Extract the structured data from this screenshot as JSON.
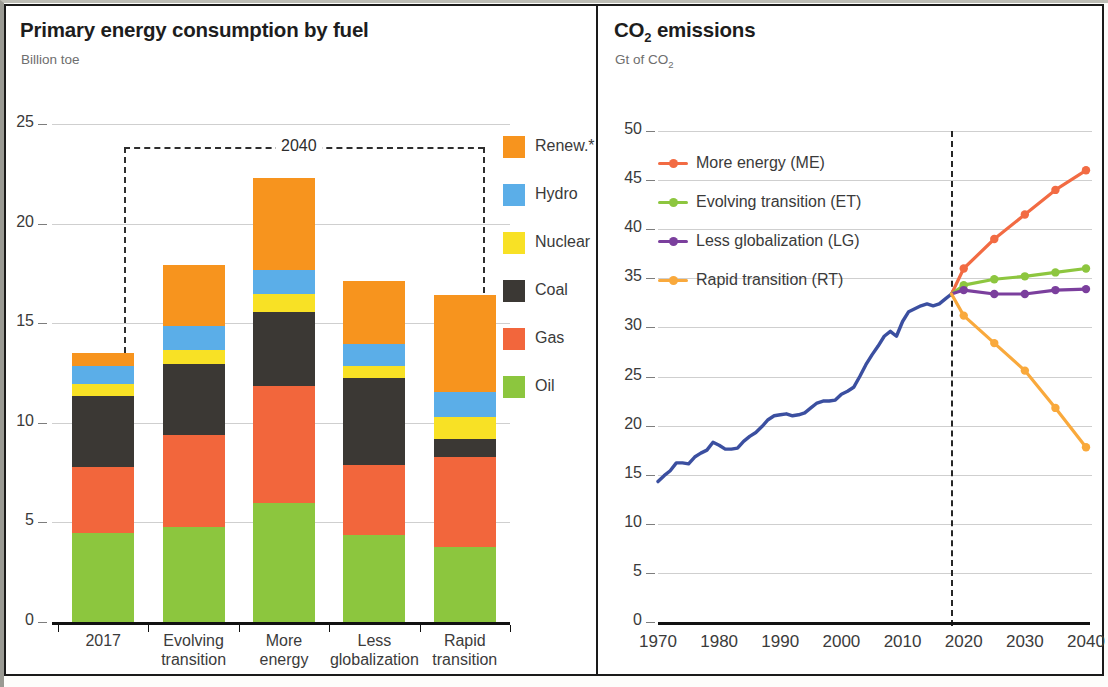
{
  "left": {
    "title": "Primary energy consumption by fuel",
    "subtitle": "Billion toe",
    "bracket_label": "2040",
    "legend": [
      {
        "label": "Renew.*",
        "color": "#F7941E"
      },
      {
        "label": "Hydro",
        "color": "#5BAEE8"
      },
      {
        "label": "Nuclear",
        "color": "#F8E125"
      },
      {
        "label": "Coal",
        "color": "#3B3834"
      },
      {
        "label": "Gas",
        "color": "#F2663C"
      },
      {
        "label": "Oil",
        "color": "#8CC63E"
      }
    ],
    "yticks": [
      "0",
      "5",
      "10",
      "15",
      "20",
      "25"
    ],
    "xlabels": [
      {
        "l1": "2017",
        "l2": ""
      },
      {
        "l1": "Evolving",
        "l2": "transition"
      },
      {
        "l1": "More",
        "l2": "energy"
      },
      {
        "l1": "Less",
        "l2": "globalization"
      },
      {
        "l1": "Rapid",
        "l2": "transition"
      }
    ]
  },
  "right": {
    "title_main": "CO",
    "title_sub": "2",
    "title_tail": " emissions",
    "subtitle_pre": "Gt of CO",
    "subtitle_sub": "2",
    "legend": [
      {
        "label": "More energy (ME)",
        "color": "#F26B43"
      },
      {
        "label": "Evolving transition (ET)",
        "color": "#8DC63F"
      },
      {
        "label": "Less globalization (LG)",
        "color": "#7B3F9D"
      },
      {
        "label": "Rapid transition (RT)",
        "color": "#F9A93C"
      }
    ],
    "yticks": [
      "0",
      "5",
      "10",
      "15",
      "20",
      "25",
      "30",
      "35",
      "40",
      "45",
      "50"
    ],
    "xticks": [
      "1970",
      "1980",
      "1990",
      "2000",
      "2010",
      "2020",
      "2030",
      "2040"
    ],
    "history_color": "#3B4FA0"
  },
  "chart_data": [
    {
      "type": "bar",
      "title": "Primary energy consumption by fuel",
      "subtitle": "Billion toe",
      "ylabel": "Billion toe",
      "xlabel": "",
      "ylim": [
        0,
        25
      ],
      "yticks": [
        0,
        5,
        10,
        15,
        20,
        25
      ],
      "grid": true,
      "stacked": true,
      "legend_position": "right",
      "annotation": "2040 bracket spans the four scenario bars",
      "categories": [
        "2017",
        "Evolving transition",
        "More energy",
        "Less globalization",
        "Rapid transition"
      ],
      "series": [
        {
          "name": "Oil",
          "color": "#8CC63E",
          "values": [
            4.5,
            4.8,
            6.0,
            4.4,
            3.8
          ]
        },
        {
          "name": "Gas",
          "color": "#F2663C",
          "values": [
            3.3,
            4.6,
            5.9,
            3.5,
            4.5
          ]
        },
        {
          "name": "Coal",
          "color": "#3B3834",
          "values": [
            3.6,
            3.6,
            3.7,
            4.4,
            0.9
          ]
        },
        {
          "name": "Nuclear",
          "color": "#F8E125",
          "values": [
            0.6,
            0.7,
            0.9,
            0.6,
            1.1
          ]
        },
        {
          "name": "Hydro",
          "color": "#5BAEE8",
          "values": [
            0.9,
            1.2,
            1.2,
            1.1,
            1.3
          ]
        },
        {
          "name": "Renew.*",
          "color": "#F7941E",
          "values": [
            0.6,
            3.0,
            4.6,
            3.1,
            4.8
          ]
        }
      ],
      "totals": [
        13.5,
        17.9,
        22.3,
        17.1,
        16.4
      ]
    },
    {
      "type": "line",
      "title": "CO2 emissions",
      "subtitle": "Gt of CO2",
      "ylabel": "Gt of CO2",
      "xlabel": "",
      "ylim": [
        0,
        50
      ],
      "xlim": [
        1970,
        2040
      ],
      "yticks": [
        0,
        5,
        10,
        15,
        20,
        25,
        30,
        35,
        40,
        45,
        50
      ],
      "xticks": [
        1970,
        1980,
        1990,
        2000,
        2010,
        2020,
        2030,
        2040
      ],
      "grid": true,
      "legend_position": "top-left",
      "vertical_divider_year": 2018,
      "series": [
        {
          "name": "History",
          "color": "#3B4FA0",
          "markers": false,
          "x": [
            1970,
            1971,
            1972,
            1973,
            1974,
            1975,
            1976,
            1977,
            1978,
            1979,
            1980,
            1981,
            1982,
            1983,
            1984,
            1985,
            1986,
            1987,
            1988,
            1989,
            1990,
            1991,
            1992,
            1993,
            1994,
            1995,
            1996,
            1997,
            1998,
            1999,
            2000,
            2001,
            2002,
            2003,
            2004,
            2005,
            2006,
            2007,
            2008,
            2009,
            2010,
            2011,
            2012,
            2013,
            2014,
            2015,
            2016,
            2017,
            2018
          ],
          "values": [
            14.3,
            14.9,
            15.4,
            16.2,
            16.2,
            16.1,
            16.8,
            17.2,
            17.5,
            18.3,
            18.0,
            17.6,
            17.6,
            17.7,
            18.4,
            18.9,
            19.3,
            19.9,
            20.6,
            21.0,
            21.1,
            21.2,
            21.0,
            21.1,
            21.3,
            21.8,
            22.3,
            22.5,
            22.5,
            22.6,
            23.2,
            23.5,
            23.9,
            25.0,
            26.2,
            27.2,
            28.1,
            29.1,
            29.6,
            29.1,
            30.6,
            31.6,
            31.9,
            32.2,
            32.4,
            32.2,
            32.4,
            32.9,
            33.4
          ]
        },
        {
          "name": "More energy (ME)",
          "color": "#F26B43",
          "markers": true,
          "x": [
            2018,
            2020,
            2025,
            2030,
            2035,
            2040
          ],
          "values": [
            33.4,
            36.0,
            39.0,
            41.5,
            44.0,
            46.0
          ]
        },
        {
          "name": "Evolving transition (ET)",
          "color": "#8DC63F",
          "markers": true,
          "x": [
            2018,
            2020,
            2025,
            2030,
            2035,
            2040
          ],
          "values": [
            33.4,
            34.3,
            34.9,
            35.2,
            35.6,
            36.0
          ]
        },
        {
          "name": "Less globalization (LG)",
          "color": "#7B3F9D",
          "markers": true,
          "x": [
            2018,
            2020,
            2025,
            2030,
            2035,
            2040
          ],
          "values": [
            33.4,
            33.8,
            33.4,
            33.4,
            33.8,
            33.9
          ]
        },
        {
          "name": "Rapid transition (RT)",
          "color": "#F9A93C",
          "markers": true,
          "x": [
            2018,
            2020,
            2025,
            2030,
            2035,
            2040
          ],
          "values": [
            33.4,
            31.2,
            28.4,
            25.6,
            21.8,
            17.8
          ]
        }
      ]
    }
  ]
}
